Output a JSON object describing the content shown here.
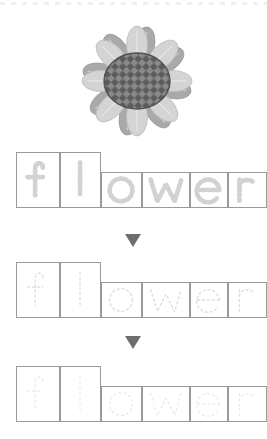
{
  "worksheet": {
    "type": "handwriting-tracing-worksheet",
    "word": "flower",
    "picture_subject": "flower",
    "letters": [
      "f",
      "l",
      "o",
      "w",
      "e",
      "r"
    ],
    "letter_heights": [
      "tall",
      "tall",
      "short",
      "short",
      "short",
      "short"
    ],
    "rows": [
      {
        "label": "trace-row-1",
        "word": "flower",
        "trace_opacity": "strong",
        "stroke_color": "#d2d2d2"
      },
      {
        "label": "trace-row-2",
        "word": "flower",
        "trace_opacity": "medium",
        "stroke_color": "#dcdcdc"
      },
      {
        "label": "trace-row-3",
        "word": "flower",
        "trace_opacity": "faint",
        "stroke_color": "#e6e6e6"
      }
    ],
    "arrows": [
      {
        "label": "step-arrow-1",
        "direction": "down",
        "color": "#6e6e6e"
      },
      {
        "label": "step-arrow-2",
        "direction": "down",
        "color": "#6e6e6e"
      }
    ],
    "top_rule": {
      "style": "dotted",
      "color": "#f0f0f0"
    },
    "cell_border_color": "#9a9a9a",
    "background_color": "#ffffff"
  },
  "flower": {
    "petal_count": 16,
    "petal_color_light": "#d6d6d6",
    "petal_color_mid": "#bfbfbf",
    "petal_color_dark": "#a8a8a8",
    "center_pattern": "checkerboard-diamond",
    "center_color_light": "#8c8c8c",
    "center_color_dark": "#5e5e5e",
    "center_outline": "#4f4f4f",
    "palette": "grayscale"
  }
}
